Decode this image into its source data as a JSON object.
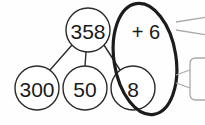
{
  "diagram": {
    "type": "number-bond-place-value",
    "nodes": {
      "whole": {
        "id": "whole",
        "label": "358",
        "cx": 88,
        "cy": 30,
        "r": 22
      },
      "parts": [
        {
          "id": "hundreds",
          "label": "300",
          "cx": 37,
          "cy": 88,
          "r": 22
        },
        {
          "id": "tens",
          "label": "50",
          "cx": 85,
          "cy": 88,
          "r": 22
        },
        {
          "id": "ones",
          "label": "8",
          "cx": 133,
          "cy": 88,
          "r": 22
        }
      ]
    },
    "operation": {
      "id": "addend",
      "label": "+ 6",
      "x": 146,
      "y": 32
    },
    "highlight": {
      "id": "grouping-oval",
      "cx": 145,
      "cy": 59,
      "rx": 31,
      "ry": 56,
      "rotation": -9
    },
    "connectors": [
      {
        "from": "whole",
        "to": "hundreds"
      },
      {
        "from": "whole",
        "to": "tens"
      },
      {
        "from": "whole",
        "to": "ones"
      }
    ],
    "callouts": [
      {
        "id": "callout-top-upper",
        "x1": 176,
        "y1": 22,
        "x2": 205,
        "y2": 18
      },
      {
        "id": "callout-top-lower",
        "x1": 176,
        "y1": 30,
        "x2": 205,
        "y2": 34
      },
      {
        "id": "callout-bottom-upper",
        "x1": 176,
        "y1": 75,
        "x2": 205,
        "y2": 70
      },
      {
        "id": "callout-bottom-lower",
        "x1": 176,
        "y1": 83,
        "x2": 205,
        "y2": 86
      }
    ],
    "colors": {
      "stroke": "#2b2b2b",
      "highlight": "#1c1c1c",
      "callout": "#a9a9a9",
      "background": "#fefefe",
      "text": "#1a1a1a"
    }
  }
}
